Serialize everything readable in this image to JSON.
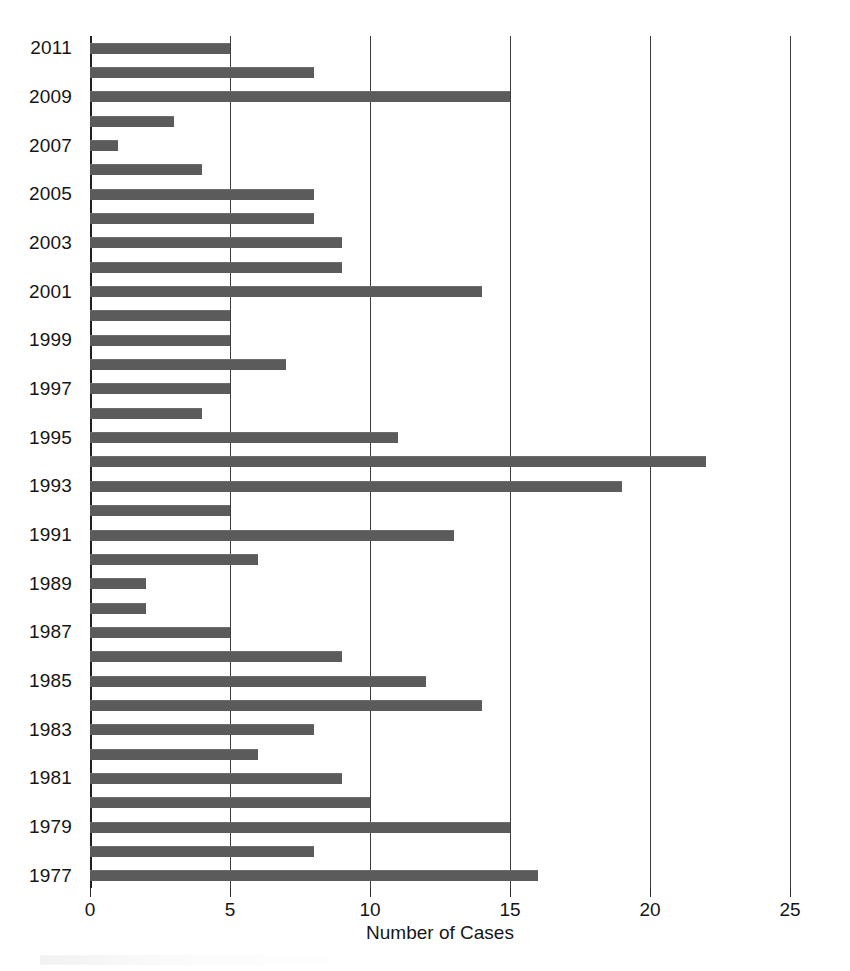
{
  "chart_data": {
    "type": "bar",
    "orientation": "horizontal",
    "title": "",
    "xlabel": "Number of Cases",
    "ylabel": "",
    "xlim": [
      0,
      25
    ],
    "ylim_categories": "1977-2011",
    "xticks": [
      0,
      5,
      10,
      15,
      20,
      25
    ],
    "xtick_labels": [
      "0",
      "5",
      "10",
      "15",
      "20",
      "25"
    ],
    "ytick_labels": [
      "1977",
      "1979",
      "1981",
      "1983",
      "1985",
      "1987",
      "1989",
      "1991",
      "1993",
      "1995",
      "1997",
      "1999",
      "2001",
      "2003",
      "2005",
      "2007",
      "2009",
      "2011"
    ],
    "grid": "vertical",
    "legend": "none",
    "bar_color": "#5b5b5b",
    "categories": [
      "2011",
      "2010",
      "2009",
      "2008",
      "2007",
      "2006",
      "2005",
      "2004",
      "2003",
      "2002",
      "2001",
      "2000",
      "1999",
      "1998",
      "1997",
      "1996",
      "1995",
      "1994",
      "1993",
      "1992",
      "1991",
      "1990",
      "1989",
      "1988",
      "1987",
      "1986",
      "1985",
      "1984",
      "1983",
      "1982",
      "1981",
      "1980",
      "1979",
      "1978",
      "1977"
    ],
    "values": [
      5,
      8,
      15,
      3,
      1,
      4,
      8,
      8,
      9,
      9,
      14,
      5,
      5,
      7,
      5,
      4,
      11,
      22,
      19,
      5,
      13,
      6,
      2,
      2,
      5,
      9,
      12,
      14,
      8,
      6,
      9,
      10,
      15,
      8,
      16
    ],
    "points": [
      {
        "year": "2011",
        "value": 5,
        "labeled": true
      },
      {
        "year": "2010",
        "value": 8,
        "labeled": false
      },
      {
        "year": "2009",
        "value": 15,
        "labeled": true
      },
      {
        "year": "2008",
        "value": 3,
        "labeled": false
      },
      {
        "year": "2007",
        "value": 1,
        "labeled": true
      },
      {
        "year": "2006",
        "value": 4,
        "labeled": false
      },
      {
        "year": "2005",
        "value": 8,
        "labeled": true
      },
      {
        "year": "2004",
        "value": 8,
        "labeled": false
      },
      {
        "year": "2003",
        "value": 9,
        "labeled": true
      },
      {
        "year": "2002",
        "value": 9,
        "labeled": false
      },
      {
        "year": "2001",
        "value": 14,
        "labeled": true
      },
      {
        "year": "2000",
        "value": 5,
        "labeled": false
      },
      {
        "year": "1999",
        "value": 5,
        "labeled": true
      },
      {
        "year": "1998",
        "value": 7,
        "labeled": false
      },
      {
        "year": "1997",
        "value": 5,
        "labeled": true
      },
      {
        "year": "1996",
        "value": 4,
        "labeled": false
      },
      {
        "year": "1995",
        "value": 11,
        "labeled": true
      },
      {
        "year": "1994",
        "value": 22,
        "labeled": false
      },
      {
        "year": "1993",
        "value": 19,
        "labeled": true
      },
      {
        "year": "1992",
        "value": 5,
        "labeled": false
      },
      {
        "year": "1991",
        "value": 13,
        "labeled": true
      },
      {
        "year": "1990",
        "value": 6,
        "labeled": false
      },
      {
        "year": "1989",
        "value": 2,
        "labeled": true
      },
      {
        "year": "1988",
        "value": 2,
        "labeled": false
      },
      {
        "year": "1987",
        "value": 5,
        "labeled": true
      },
      {
        "year": "1986",
        "value": 9,
        "labeled": false
      },
      {
        "year": "1985",
        "value": 12,
        "labeled": true
      },
      {
        "year": "1984",
        "value": 14,
        "labeled": false
      },
      {
        "year": "1983",
        "value": 8,
        "labeled": true
      },
      {
        "year": "1982",
        "value": 6,
        "labeled": false
      },
      {
        "year": "1981",
        "value": 9,
        "labeled": true
      },
      {
        "year": "1980",
        "value": 10,
        "labeled": false
      },
      {
        "year": "1979",
        "value": 15,
        "labeled": true
      },
      {
        "year": "1978",
        "value": 8,
        "labeled": false
      },
      {
        "year": "1977",
        "value": 16,
        "labeled": true
      }
    ]
  },
  "axis": {
    "x_title": "Number of Cases"
  }
}
